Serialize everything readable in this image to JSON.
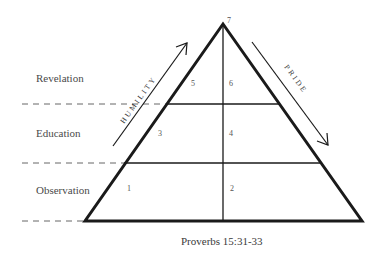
{
  "levels": [
    {
      "label": "Revelation"
    },
    {
      "label": "Education"
    },
    {
      "label": "Observation"
    }
  ],
  "cells": {
    "c1": "1",
    "c2": "2",
    "c3": "3",
    "c4": "4",
    "c5": "5",
    "c6": "6",
    "c7": "7"
  },
  "arrows": {
    "left": "HUMILITY",
    "right": "PRIDE"
  },
  "caption": "Proverbs 15:31-33",
  "colors": {
    "line": "#1a1a1a",
    "dash": "#555555",
    "text": "#4a4a4a"
  }
}
